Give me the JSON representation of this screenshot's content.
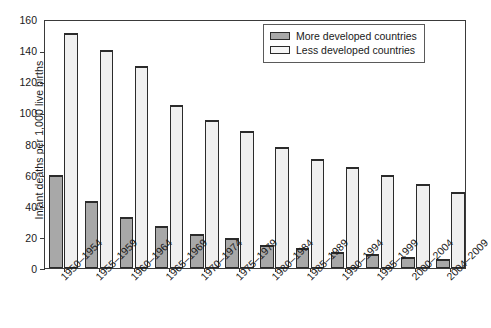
{
  "chart_data": {
    "type": "bar",
    "title": "",
    "xlabel": "",
    "ylabel": "Infant deaths per 1,000 live births",
    "ylim": [
      0,
      160
    ],
    "ytick_step": 20,
    "yticks": [
      "0",
      "20",
      "40",
      "60",
      "80",
      "100",
      "120",
      "140",
      "160"
    ],
    "grid": false,
    "legend_position": "top-right",
    "categories": [
      "1950–1954",
      "1955–1959",
      "1960–1964",
      "1965–1969",
      "1970–1974",
      "1975–1979",
      "1980–1984",
      "1985–1989",
      "1990–1994",
      "1995–1999",
      "2000–2004",
      "2004–2009"
    ],
    "series": [
      {
        "name": "More developed countries",
        "color": "#a8a8a8",
        "values": [
          60,
          43,
          33,
          27,
          22,
          19,
          15,
          13,
          10,
          9,
          7,
          6
        ]
      },
      {
        "name": "Less developed countries",
        "color": "#f0f0f0",
        "values": [
          151,
          140,
          130,
          105,
          95,
          88,
          78,
          70,
          65,
          60,
          54,
          49
        ]
      }
    ]
  }
}
